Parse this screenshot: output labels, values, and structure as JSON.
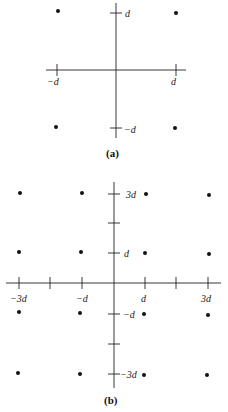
{
  "figure_a": {
    "caption": "(a)",
    "labels": {
      "x_neg": "−d",
      "x_pos": "d",
      "y_pos": "d",
      "y_neg": "−d"
    },
    "points": [
      [
        -1,
        1
      ],
      [
        1,
        1
      ],
      [
        -1,
        -1
      ],
      [
        1,
        -1
      ]
    ]
  },
  "figure_b": {
    "caption": "(b)",
    "labels": {
      "x_m3": "−3d",
      "x_m1": "−d",
      "x_p1": "d",
      "x_p3": "3d",
      "y_p3": "3d",
      "y_p1": "d",
      "y_m1": "−d",
      "y_m3": "−3d"
    },
    "points": [
      [
        -3,
        3
      ],
      [
        -1,
        3
      ],
      [
        1,
        3
      ],
      [
        3,
        3
      ],
      [
        -3,
        1
      ],
      [
        -1,
        1
      ],
      [
        1,
        1
      ],
      [
        3,
        1
      ],
      [
        -3,
        -1
      ],
      [
        -1,
        -1
      ],
      [
        1,
        -1
      ],
      [
        3,
        -1
      ],
      [
        -3,
        -3
      ],
      [
        -1,
        -3
      ],
      [
        1,
        -3
      ],
      [
        3,
        -3
      ]
    ]
  },
  "colors": {
    "ink": "#111111",
    "background": "#ffffff"
  }
}
